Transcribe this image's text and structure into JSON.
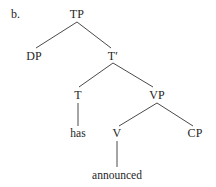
{
  "figure": {
    "letter": "b.",
    "caption": "",
    "type": "syntax-tree",
    "background_color": "#ffffff",
    "line_color": "#4a4a4a",
    "text_color": "#262626"
  },
  "tree": {
    "root": "TP",
    "nodes": [
      {
        "id": "TP",
        "label": "TP",
        "kind": "phrasal",
        "x": 77,
        "y": 18
      },
      {
        "id": "DP",
        "label": "DP",
        "kind": "phrasal",
        "x": 34,
        "y": 60
      },
      {
        "id": "Tbar",
        "label": "T′",
        "kind": "bar",
        "x": 113,
        "y": 60
      },
      {
        "id": "T",
        "label": "T",
        "kind": "head",
        "x": 78,
        "y": 99
      },
      {
        "id": "VP",
        "label": "VP",
        "kind": "phrasal",
        "x": 157,
        "y": 99
      },
      {
        "id": "has",
        "label": "has",
        "kind": "terminal",
        "x": 78,
        "y": 137
      },
      {
        "id": "V",
        "label": "V",
        "kind": "head",
        "x": 117,
        "y": 137
      },
      {
        "id": "CP",
        "label": "CP",
        "kind": "phrasal",
        "x": 195,
        "y": 137
      },
      {
        "id": "announced",
        "label": "announced",
        "kind": "terminal",
        "x": 117,
        "y": 179
      }
    ],
    "edges": [
      {
        "from": "TP",
        "to": "DP",
        "x1": 77,
        "y1": 22,
        "x2": 36,
        "y2": 48
      },
      {
        "from": "TP",
        "to": "Tbar",
        "x1": 77,
        "y1": 22,
        "x2": 111,
        "y2": 48
      },
      {
        "from": "Tbar",
        "to": "T",
        "x1": 113,
        "y1": 63,
        "x2": 79,
        "y2": 87
      },
      {
        "from": "Tbar",
        "to": "VP",
        "x1": 113,
        "y1": 63,
        "x2": 153,
        "y2": 87
      },
      {
        "from": "T",
        "to": "has",
        "x1": 78,
        "y1": 103,
        "x2": 78,
        "y2": 126
      },
      {
        "from": "VP",
        "to": "V",
        "x1": 157,
        "y1": 103,
        "x2": 119,
        "y2": 126
      },
      {
        "from": "VP",
        "to": "CP",
        "x1": 157,
        "y1": 103,
        "x2": 193,
        "y2": 126
      },
      {
        "from": "V",
        "to": "announced",
        "x1": 117,
        "y1": 141,
        "x2": 117,
        "y2": 167
      }
    ]
  },
  "labels": {
    "figure_letter": "b.",
    "TP": "TP",
    "DP": "DP",
    "Tbar": "T′",
    "T": "T",
    "VP": "VP",
    "has": "has",
    "V": "V",
    "CP": "CP",
    "announced": "announced"
  },
  "letter_position": {
    "x": 11,
    "y": 18
  }
}
